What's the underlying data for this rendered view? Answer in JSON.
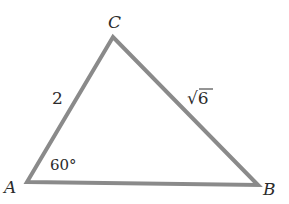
{
  "diagram": {
    "type": "triangle",
    "stroke_color": "#8a8a8a",
    "text_color": "#2b2b2b",
    "vertices": [
      {
        "name": "A",
        "x": 27,
        "y": 182
      },
      {
        "name": "B",
        "x": 258,
        "y": 185
      },
      {
        "name": "C",
        "x": 113,
        "y": 37
      }
    ],
    "labels": {
      "vertex_a": "A",
      "vertex_b": "B",
      "vertex_c": "C",
      "side_ac": "2",
      "side_bc": "√6",
      "angle_a": "60°"
    }
  }
}
